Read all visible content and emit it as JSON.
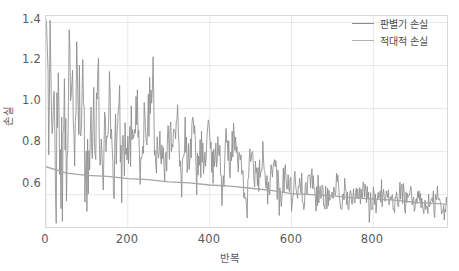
{
  "chart_data": {
    "type": "line",
    "title": "",
    "xlabel": "반복",
    "ylabel": "손실",
    "xlim": [
      0,
      980
    ],
    "ylim": [
      0.45,
      1.43
    ],
    "xticks": [
      0,
      200,
      400,
      600,
      800
    ],
    "xtick_labels": [
      "0",
      "200",
      "400",
      "600",
      "800"
    ],
    "yticks": [
      0.6,
      0.8,
      1.0,
      1.2,
      1.4
    ],
    "ytick_labels": [
      "0.6",
      "0.8",
      "1.0",
      "1.2",
      "1.4"
    ],
    "grid": true,
    "legend_position": "upper right",
    "series": [
      {
        "name": "판별기 손실",
        "color": "#8c8c8c",
        "x": [
          0,
          5,
          10,
          15,
          20,
          25,
          30,
          35,
          40,
          45,
          50,
          55,
          60,
          65,
          70,
          75,
          80,
          85,
          90,
          95,
          100,
          105,
          110,
          115,
          120,
          125,
          130,
          135,
          140,
          145,
          150,
          155,
          160,
          165,
          170,
          175,
          180,
          185,
          190,
          195,
          200,
          210,
          220,
          230,
          240,
          250,
          260,
          270,
          280,
          290,
          300,
          310,
          320,
          330,
          340,
          350,
          360,
          370,
          380,
          390,
          400,
          410,
          420,
          430,
          440,
          450,
          460,
          470,
          480,
          490,
          500,
          510,
          520,
          530,
          540,
          550,
          560,
          570,
          580,
          590,
          600,
          610,
          620,
          630,
          640,
          650,
          660,
          670,
          680,
          690,
          700,
          710,
          720,
          730,
          740,
          750,
          760,
          770,
          780,
          790,
          800,
          810,
          820,
          830,
          840,
          850,
          860,
          870,
          880,
          890,
          900,
          910,
          920,
          930,
          940,
          950,
          960,
          970,
          980
        ],
        "values": [
          1.33,
          0.92,
          1.39,
          0.86,
          0.95,
          0.79,
          1.11,
          0.88,
          0.6,
          1.04,
          0.83,
          1.21,
          0.9,
          1.14,
          0.77,
          1.1,
          1.0,
          0.85,
          1.22,
          0.7,
          0.52,
          0.95,
          0.88,
          1.05,
          0.79,
          1.18,
          0.92,
          0.83,
          0.74,
          0.98,
          0.86,
          1.16,
          0.8,
          0.7,
          0.9,
          0.81,
          0.96,
          0.72,
          0.88,
          0.79,
          0.94,
          0.86,
          1.02,
          0.76,
          0.9,
          1.0,
          1.15,
          0.73,
          0.88,
          0.8,
          0.92,
          0.84,
          0.96,
          0.7,
          0.86,
          0.78,
          0.93,
          0.68,
          0.82,
          0.75,
          0.9,
          0.72,
          0.85,
          0.66,
          0.81,
          0.77,
          0.88,
          0.7,
          0.74,
          0.52,
          0.8,
          0.71,
          0.65,
          0.76,
          0.62,
          0.69,
          0.74,
          0.58,
          0.66,
          0.71,
          0.6,
          0.63,
          0.7,
          0.55,
          0.64,
          0.68,
          0.59,
          0.66,
          0.57,
          0.62,
          0.6,
          0.66,
          0.54,
          0.61,
          0.58,
          0.63,
          0.56,
          0.6,
          0.64,
          0.53,
          0.59,
          0.57,
          0.62,
          0.55,
          0.6,
          0.52,
          0.58,
          0.63,
          0.56,
          0.59,
          0.54,
          0.61,
          0.57,
          0.53,
          0.58,
          0.55,
          0.6,
          0.52,
          0.56
        ]
      },
      {
        "name": "적대적 손실",
        "color": "#a6a6a6",
        "x": [
          0,
          50,
          100,
          150,
          200,
          250,
          300,
          350,
          400,
          450,
          500,
          550,
          600,
          650,
          700,
          750,
          800,
          850,
          900,
          950,
          980
        ],
        "values": [
          0.73,
          0.7,
          0.69,
          0.685,
          0.675,
          0.67,
          0.66,
          0.655,
          0.645,
          0.64,
          0.63,
          0.62,
          0.605,
          0.6,
          0.595,
          0.585,
          0.58,
          0.575,
          0.565,
          0.56,
          0.555
        ]
      }
    ]
  }
}
